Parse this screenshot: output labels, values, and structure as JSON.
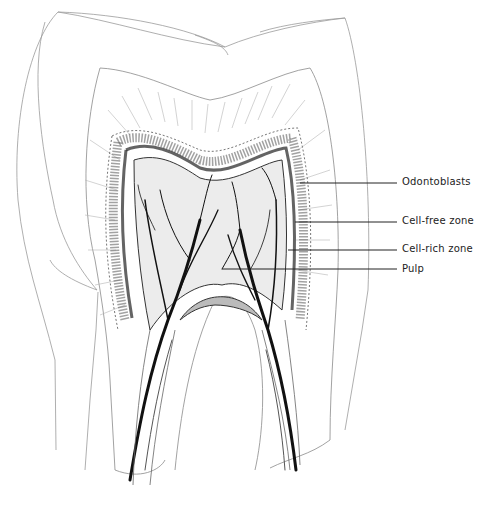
{
  "diagram": {
    "colors": {
      "ink": "#1a1a1a",
      "faint": "#9a9a9a",
      "paper": "#ffffff"
    },
    "labels": [
      {
        "id": "odontoblasts",
        "text": "Odontoblasts",
        "x": 402,
        "y": 176,
        "line_from_x": 300,
        "line_y": 183
      },
      {
        "id": "cell-free-zone",
        "text": "Cell-free zone",
        "x": 402,
        "y": 215,
        "line_from_x": 295,
        "line_y": 222
      },
      {
        "id": "cell-rich-zone",
        "text": "Cell-rich zone",
        "x": 402,
        "y": 243,
        "line_from_x": 288,
        "line_y": 250
      },
      {
        "id": "pulp",
        "text": "Pulp",
        "x": 402,
        "y": 263,
        "line_from_x": 222,
        "line_y": 269
      }
    ]
  }
}
